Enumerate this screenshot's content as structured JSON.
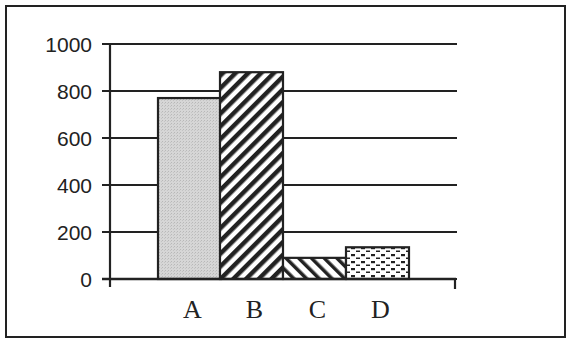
{
  "chart_data": {
    "type": "bar",
    "title": "",
    "xlabel": "",
    "ylabel": "",
    "categories": [
      "A",
      "B",
      "C",
      "D"
    ],
    "values": [
      770,
      880,
      90,
      135
    ],
    "ylim": [
      0,
      1000
    ],
    "yticks": [
      0,
      200,
      400,
      600,
      800,
      1000
    ],
    "ytick_labels": [
      "0",
      "200",
      "400",
      "600",
      "800",
      "1000"
    ],
    "grid": true,
    "legend": null,
    "bar_fills": [
      "light-gray-stipple",
      "dense-diagonal-hatch",
      "sparse-diagonal-hatch",
      "dotted-dash"
    ]
  },
  "colors": {
    "ink": "#222222",
    "background": "#ffffff",
    "bar_a_fill": "#d4d4d4"
  }
}
